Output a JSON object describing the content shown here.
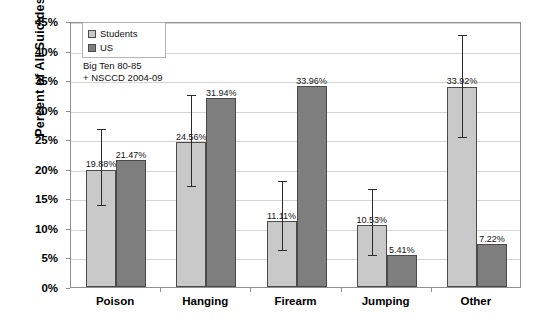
{
  "chart_data": {
    "type": "bar",
    "title": "",
    "xlabel": "",
    "ylabel": "Percent of All Suicides",
    "ylim": [
      0,
      45
    ],
    "ytick_labels": [
      "0%",
      "5%",
      "10%",
      "15%",
      "20%",
      "25%",
      "30%",
      "35%",
      "40%",
      "45%"
    ],
    "ytick_values": [
      0,
      5,
      10,
      15,
      20,
      25,
      30,
      35,
      40,
      45
    ],
    "grid": true,
    "legend_position": "top-left",
    "categories": [
      "Poison",
      "Hanging",
      "Firearm",
      "Jumping",
      "Other"
    ],
    "series": [
      {
        "name": "Students",
        "color": "#c9c9c9",
        "values": [
          19.88,
          24.56,
          11.11,
          10.53,
          33.92
        ],
        "value_labels": [
          "19.88%",
          "24.56%",
          "11.11%",
          "10.53%",
          "33.92%"
        ],
        "error_bars": [
          {
            "low": 14.0,
            "high": 27.0
          },
          {
            "low": 17.3,
            "high": 32.8
          },
          {
            "low": 6.4,
            "high": 18.3
          },
          {
            "low": 5.6,
            "high": 17.0
          },
          {
            "low": 25.6,
            "high": 43.0
          }
        ]
      },
      {
        "name": "US",
        "color": "#7e7e7e",
        "values": [
          21.47,
          31.94,
          33.96,
          5.41,
          7.22
        ],
        "value_labels": [
          "21.47%",
          "31.94%",
          "33.96%",
          "5.41%",
          "7.22%"
        ],
        "error_bars": [
          null,
          null,
          null,
          null,
          null
        ]
      }
    ],
    "annotations": [
      "Big  Ten 80-85",
      "+ NSCCD 2004-09"
    ]
  },
  "legend": {
    "items": [
      {
        "label": "Students",
        "swatch": "students-swatch"
      },
      {
        "label": "US",
        "swatch": "us-swatch"
      }
    ]
  },
  "annotation": {
    "line1": "Big  Ten 80-85",
    "line2": "+ NSCCD 2004-09"
  },
  "axes": {
    "y_title": "Percent of All Suicides"
  }
}
